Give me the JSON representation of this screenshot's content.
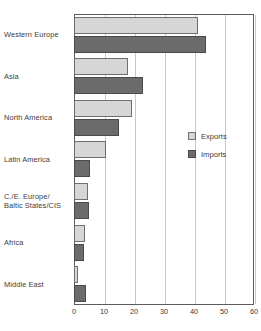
{
  "chart": {
    "type": "bar",
    "orientation": "horizontal",
    "background_color": "#ffffff",
    "frame_color": "#5b5b5b",
    "grid_color": "#c9c9c9"
  },
  "legend": {
    "position": "inside-right",
    "items": [
      {
        "label": "Exports",
        "color": "#d6d6d6",
        "swatch_name": "exports-swatch"
      },
      {
        "label": "Imports",
        "color": "#6b6b6b",
        "swatch_name": "imports-swatch"
      }
    ]
  },
  "chart_data": {
    "type": "bar",
    "title": "",
    "xlabel": "",
    "ylabel": "",
    "xlim": [
      0,
      60
    ],
    "ylim": null,
    "grid": true,
    "legend_position": "inside-right",
    "categories": [
      "Western Europe",
      "Asia",
      "North America",
      "Latin America",
      "C./E. Europe/ Baltic States/CIS",
      "Africa",
      "Middle East"
    ],
    "category_lines": [
      [
        "Western Europe"
      ],
      [
        "Asia"
      ],
      [
        "North America"
      ],
      [
        "Latin America"
      ],
      [
        "C./E. Europe/",
        "Baltic States/CIS"
      ],
      [
        "Africa"
      ],
      [
        "Middle East"
      ]
    ],
    "xticks": [
      0,
      10,
      20,
      30,
      40,
      50,
      60
    ],
    "xticklabels": [
      "0",
      "10",
      "20",
      "30",
      "40",
      "50",
      "60"
    ],
    "series": [
      {
        "name": "Exports",
        "color": "#d6d6d6",
        "values": [
          41.3,
          18.0,
          19.3,
          10.8,
          4.5,
          3.6,
          1.4
        ]
      },
      {
        "name": "Imports",
        "color": "#6b6b6b",
        "values": [
          44.0,
          23.0,
          15.0,
          5.4,
          5.0,
          3.4,
          4.0
        ]
      }
    ]
  }
}
